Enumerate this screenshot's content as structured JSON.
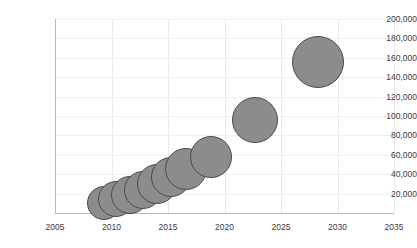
{
  "chart_data": {
    "type": "scatter",
    "title": "",
    "xlabel": "",
    "ylabel": "",
    "xlim": [
      2005,
      2035
    ],
    "ylim": [
      0,
      200000
    ],
    "grid": true,
    "legend": null,
    "x_ticks": [
      "2005",
      "2010",
      "2015",
      "2020",
      "2025",
      "2030",
      "2035"
    ],
    "x_tick_values": [
      2005,
      2010,
      2015,
      2020,
      2025,
      2030,
      2035
    ],
    "y_ticks": [
      "20,000",
      "40,000",
      "60,000",
      "80,000",
      "100,000",
      "120,000",
      "140,000",
      "160,000",
      "180,000",
      "200,000"
    ],
    "y_tick_values": [
      20000,
      40000,
      60000,
      80000,
      100000,
      120000,
      140000,
      160000,
      180000,
      200000
    ],
    "marker_fill": "#8c8c8c",
    "marker_border": "#4a4a4a",
    "points": [
      {
        "x": 2009.3,
        "y": 10000,
        "r": 17
      },
      {
        "x": 2010.4,
        "y": 14000,
        "r": 18
      },
      {
        "x": 2011.6,
        "y": 19000,
        "r": 19
      },
      {
        "x": 2012.8,
        "y": 24000,
        "r": 19
      },
      {
        "x": 2014.0,
        "y": 30000,
        "r": 20
      },
      {
        "x": 2015.3,
        "y": 37000,
        "r": 20
      },
      {
        "x": 2016.6,
        "y": 45000,
        "r": 21
      },
      {
        "x": 2018.8,
        "y": 58000,
        "r": 21
      },
      {
        "x": 2022.7,
        "y": 96000,
        "r": 23
      },
      {
        "x": 2028.3,
        "y": 156000,
        "r": 26
      }
    ]
  }
}
